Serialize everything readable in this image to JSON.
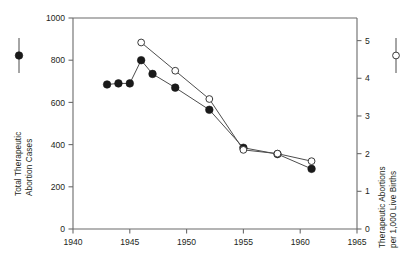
{
  "chart_data": {
    "type": "line",
    "title": "",
    "xlabel": "",
    "xlim": [
      1940,
      1965
    ],
    "xticks": [
      1940,
      1945,
      1950,
      1955,
      1960,
      1965
    ],
    "xticklabels": [
      "1940",
      "1945",
      "1950",
      "1955",
      "1960",
      "1965"
    ],
    "grid": false,
    "legend_position": "outside-left-and-right",
    "axes": [
      {
        "id": "left",
        "label": "Total Therapeutic Abortion Cases",
        "label_lines": [
          "Total Therapeutic",
          "Abortion Cases"
        ],
        "lim": [
          0,
          1000
        ],
        "ticks": [
          0,
          200,
          400,
          600,
          800,
          1000
        ],
        "ticklabels": [
          "0",
          "200",
          "400",
          "600",
          "800",
          "1000"
        ]
      },
      {
        "id": "right",
        "label": "Therapeutic Abortions per 1,000 Live Births",
        "label_lines": [
          "Therapeutic Abortions",
          "per 1,000 Live Births"
        ],
        "lim": [
          0,
          5.6
        ],
        "ticks": [
          0,
          1,
          2,
          3,
          4,
          5
        ],
        "ticklabels": [
          "0",
          "1",
          "2",
          "3",
          "4",
          "5"
        ]
      }
    ],
    "series": [
      {
        "name": "Total Therapeutic Abortion Cases",
        "marker": "filled-circle",
        "axis": "left",
        "color": "#1a1a1a",
        "x": [
          1943,
          1944,
          1945,
          1946,
          1947,
          1949,
          1952,
          1955,
          1958,
          1961
        ],
        "values": [
          685,
          690,
          690,
          800,
          735,
          670,
          565,
          385,
          355,
          285
        ]
      },
      {
        "name": "Therapeutic Abortions per 1,000 Live Births",
        "marker": "open-circle",
        "axis": "right",
        "color": "#1a1a1a",
        "x": [
          1946,
          1949,
          1952,
          1955,
          1958,
          1961
        ],
        "values": [
          4.95,
          4.2,
          3.45,
          2.1,
          2.0,
          1.8
        ]
      }
    ],
    "legend": [
      {
        "key": "filled-circle",
        "position": "left",
        "series": "Total Therapeutic Abortion Cases"
      },
      {
        "key": "open-circle",
        "position": "right",
        "series": "Therapeutic Abortions per 1,000 Live Births"
      }
    ]
  },
  "colors": {
    "axis": "#6b6b6b",
    "text": "#231f20",
    "marker_fill": "#1a1a1a",
    "marker_open_fill": "#ffffff",
    "line": "#4d4d4d",
    "background": "#ffffff"
  }
}
